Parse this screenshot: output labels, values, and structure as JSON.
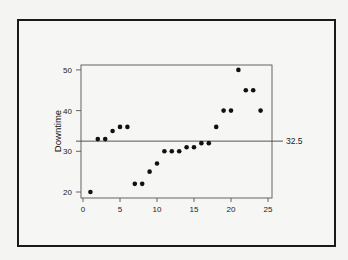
{
  "chart_data": {
    "type": "scatter",
    "title": "",
    "xlabel": "",
    "ylabel": "Downtime",
    "xlim": [
      0,
      25
    ],
    "ylim": [
      18.5,
      51.5
    ],
    "xticks": [
      0,
      5,
      10,
      15,
      20,
      25
    ],
    "yticks": [
      20,
      30,
      40,
      50
    ],
    "grid": false,
    "legend": null,
    "x": [
      1,
      2,
      3,
      4,
      5,
      6,
      7,
      8,
      9,
      10,
      11,
      12,
      13,
      14,
      15,
      16,
      17,
      18,
      19,
      20,
      21,
      22,
      23,
      24
    ],
    "series": [
      {
        "name": "Downtime",
        "values": [
          20,
          33,
          33,
          35,
          36,
          36,
          22,
          22,
          25,
          27,
          30,
          30,
          30,
          31,
          31,
          32,
          32,
          36,
          40,
          40,
          50,
          45,
          45,
          40
        ]
      }
    ],
    "reference_lines": [
      {
        "type": "horizontal",
        "y": 32.5,
        "label": "32.5"
      }
    ]
  },
  "labels": {
    "ylabel": "Downtime",
    "median_label": "32.5",
    "xticks": [
      "0",
      "5",
      "10",
      "15",
      "20",
      "25"
    ],
    "yticks": [
      "20",
      "30",
      "40",
      "50"
    ]
  },
  "colors": {
    "points": "#111111",
    "frame": "#555555",
    "outer_border": "#1a1a1a",
    "background": "#f6f6f4"
  }
}
